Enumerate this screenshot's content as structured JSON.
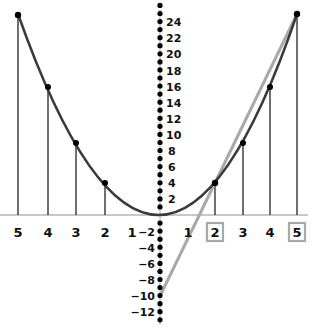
{
  "diagram": {
    "type": "parabola-secant",
    "function": "y = x^2",
    "colors": {
      "curve": "#3a3a3a",
      "secant_line": "#a9a9a9",
      "axis": "#c8c8c8",
      "points": "#000000",
      "highlight_box": "#a9a9a9",
      "text": "#111111"
    },
    "x_axis": {
      "ticks_left": [
        "5",
        "4",
        "3",
        "2",
        "1"
      ],
      "ticks_right": [
        "1",
        "2",
        "3",
        "4",
        "5"
      ],
      "highlighted": [
        "2",
        "5"
      ]
    },
    "y_axis": {
      "ticks_positive": [
        "24",
        "22",
        "20",
        "18",
        "16",
        "14",
        "12",
        "10",
        "8",
        "6",
        "4",
        "2"
      ],
      "ticks_negative": [
        "−2",
        "−4",
        "−6",
        "−8",
        "−10",
        "−12"
      ]
    },
    "points": [
      {
        "x": -5,
        "y": 25
      },
      {
        "x": -4,
        "y": 16
      },
      {
        "x": -3,
        "y": 9
      },
      {
        "x": -2,
        "y": 4
      },
      {
        "x": 2,
        "y": 4
      },
      {
        "x": 3,
        "y": 9
      },
      {
        "x": 4,
        "y": 16
      },
      {
        "x": 5,
        "y": 25
      }
    ],
    "secant": {
      "from": {
        "x": 0,
        "y": -10
      },
      "to": {
        "x": 5,
        "y": 25
      },
      "through": [
        {
          "x": 2,
          "y": 4
        }
      ]
    }
  },
  "labels": {
    "x_left": [
      "5",
      "4",
      "3",
      "2",
      "1"
    ],
    "x_right": [
      "1",
      "2",
      "3",
      "4",
      "5"
    ],
    "y_pos": [
      "24",
      "22",
      "20",
      "18",
      "16",
      "14",
      "12",
      "10",
      "8",
      "6",
      "4",
      "2"
    ],
    "y_neg": [
      "−2",
      "−4",
      "−6",
      "−8",
      "−10",
      "−12"
    ]
  }
}
